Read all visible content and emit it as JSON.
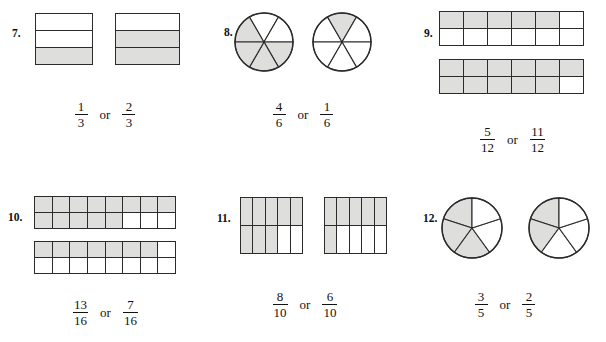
{
  "page": {
    "kind": "fractions-comparison-worksheet",
    "shade_color": "#dededc",
    "line_color": "#2b2b2b",
    "or_label": "or"
  },
  "problems": [
    {
      "number": "7.",
      "figure_type": "bar-rows",
      "left_fraction": {
        "numerator": "1",
        "denominator": "3"
      },
      "right_fraction": {
        "numerator": "2",
        "denominator": "3"
      },
      "left_figure": {
        "rows": 3,
        "cols": 1,
        "shaded_cells": 1,
        "total_cells": 3,
        "shaded_from": "bottom"
      },
      "right_figure": {
        "rows": 3,
        "cols": 1,
        "shaded_cells": 2,
        "total_cells": 3,
        "shaded_from": "bottom"
      }
    },
    {
      "number": "8.",
      "figure_type": "circle-sectors",
      "left_fraction": {
        "numerator": "4",
        "denominator": "6"
      },
      "right_fraction": {
        "numerator": "1",
        "denominator": "6"
      },
      "left_figure": {
        "sectors": 6,
        "shaded_sectors": 4
      },
      "right_figure": {
        "sectors": 6,
        "shaded_sectors": 1
      }
    },
    {
      "number": "9.",
      "figure_type": "bar-grid-stacked",
      "left_fraction": {
        "numerator": "5",
        "denominator": "12"
      },
      "right_fraction": {
        "numerator": "11",
        "denominator": "12"
      },
      "left_figure": {
        "rows": 2,
        "cols": 6,
        "shaded_cells": 5,
        "total_cells": 12
      },
      "right_figure": {
        "rows": 2,
        "cols": 6,
        "shaded_cells": 11,
        "total_cells": 12
      }
    },
    {
      "number": "10.",
      "figure_type": "bar-grid-stacked",
      "left_fraction": {
        "numerator": "13",
        "denominator": "16"
      },
      "right_fraction": {
        "numerator": "7",
        "denominator": "16"
      },
      "left_figure": {
        "rows": 2,
        "cols": 8,
        "shaded_cells": 13,
        "total_cells": 16
      },
      "right_figure": {
        "rows": 2,
        "cols": 8,
        "shaded_cells": 7,
        "total_cells": 16
      }
    },
    {
      "number": "11.",
      "figure_type": "bar-grid",
      "left_fraction": {
        "numerator": "8",
        "denominator": "10"
      },
      "right_fraction": {
        "numerator": "6",
        "denominator": "10"
      },
      "left_figure": {
        "rows": 2,
        "cols": 5,
        "shaded_cells": 8,
        "total_cells": 10
      },
      "right_figure": {
        "rows": 2,
        "cols": 5,
        "shaded_cells": 6,
        "total_cells": 10
      }
    },
    {
      "number": "12.",
      "figure_type": "circle-sectors",
      "left_fraction": {
        "numerator": "3",
        "denominator": "5"
      },
      "right_fraction": {
        "numerator": "2",
        "denominator": "5"
      },
      "left_figure": {
        "sectors": 5,
        "shaded_sectors": 3
      },
      "right_figure": {
        "sectors": 5,
        "shaded_sectors": 2
      }
    }
  ]
}
